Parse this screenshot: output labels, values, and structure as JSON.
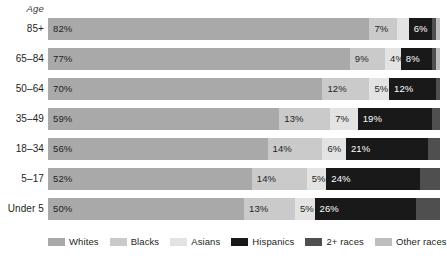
{
  "chart_data": {
    "type": "bar",
    "subtype": "horizontal-100-percent-stacked",
    "title": "",
    "xlabel": "",
    "ylabel": "Age",
    "xlim": [
      0,
      100
    ],
    "grid": false,
    "legend_position": "bottom",
    "categories": [
      "85+",
      "65–84",
      "50–64",
      "35–49",
      "18–34",
      "5–17",
      "Under 5"
    ],
    "series": [
      {
        "name": "Whites",
        "color": "#a9a9a9",
        "values": [
          82,
          77,
          70,
          59,
          56,
          52,
          50
        ]
      },
      {
        "name": "Blacks",
        "color": "#cacaca",
        "values": [
          7,
          9,
          12,
          13,
          14,
          14,
          13
        ]
      },
      {
        "name": "Asians",
        "color": "#e3e3e3",
        "values": [
          3,
          4,
          5,
          7,
          6,
          5,
          5
        ]
      },
      {
        "name": "Hispanics",
        "color": "#191919",
        "values": [
          6,
          8,
          12,
          19,
          21,
          24,
          26
        ]
      },
      {
        "name": "2+ races",
        "color": "#4f4f4f",
        "values": [
          1,
          1,
          1,
          2,
          3,
          5,
          6
        ]
      },
      {
        "name": "Other races",
        "color": "#bdbdbd",
        "values": [
          1,
          1,
          0,
          0,
          0,
          0,
          0
        ]
      }
    ],
    "rows": [
      {
        "category": "85+",
        "segments": [
          {
            "series": "Whites",
            "value": 82,
            "label": "82%",
            "show_label": true,
            "tone": "light"
          },
          {
            "series": "Blacks",
            "value": 7,
            "label": "7%",
            "show_label": true,
            "tone": "light"
          },
          {
            "series": "Asians",
            "value": 3,
            "label": "3%",
            "show_label": false,
            "tone": "light"
          },
          {
            "series": "Hispanics",
            "value": 6,
            "label": "6%",
            "show_label": true,
            "tone": "dark"
          },
          {
            "series": "2+ races",
            "value": 1,
            "label": "1%",
            "show_label": false,
            "tone": "dark"
          },
          {
            "series": "Other races",
            "value": 1,
            "label": "1%",
            "show_label": false,
            "tone": "light"
          }
        ]
      },
      {
        "category": "65–84",
        "segments": [
          {
            "series": "Whites",
            "value": 77,
            "label": "77%",
            "show_label": true,
            "tone": "light"
          },
          {
            "series": "Blacks",
            "value": 9,
            "label": "9%",
            "show_label": true,
            "tone": "light"
          },
          {
            "series": "Asians",
            "value": 4,
            "label": "4%",
            "show_label": true,
            "tone": "light"
          },
          {
            "series": "Hispanics",
            "value": 8,
            "label": "8%",
            "show_label": true,
            "tone": "dark"
          },
          {
            "series": "2+ races",
            "value": 1,
            "label": "1%",
            "show_label": false,
            "tone": "dark"
          },
          {
            "series": "Other races",
            "value": 1,
            "label": "1%",
            "show_label": false,
            "tone": "light"
          }
        ]
      },
      {
        "category": "50–64",
        "segments": [
          {
            "series": "Whites",
            "value": 70,
            "label": "70%",
            "show_label": true,
            "tone": "light"
          },
          {
            "series": "Blacks",
            "value": 12,
            "label": "12%",
            "show_label": true,
            "tone": "light"
          },
          {
            "series": "Asians",
            "value": 5,
            "label": "5%",
            "show_label": true,
            "tone": "light"
          },
          {
            "series": "Hispanics",
            "value": 12,
            "label": "12%",
            "show_label": true,
            "tone": "dark"
          },
          {
            "series": "2+ races",
            "value": 1,
            "label": "1%",
            "show_label": false,
            "tone": "dark"
          }
        ]
      },
      {
        "category": "35–49",
        "segments": [
          {
            "series": "Whites",
            "value": 59,
            "label": "59%",
            "show_label": true,
            "tone": "light"
          },
          {
            "series": "Blacks",
            "value": 13,
            "label": "13%",
            "show_label": true,
            "tone": "light"
          },
          {
            "series": "Asians",
            "value": 7,
            "label": "7%",
            "show_label": true,
            "tone": "light"
          },
          {
            "series": "Hispanics",
            "value": 19,
            "label": "19%",
            "show_label": true,
            "tone": "dark"
          },
          {
            "series": "2+ races",
            "value": 2,
            "label": "2%",
            "show_label": false,
            "tone": "dark"
          }
        ]
      },
      {
        "category": "18–34",
        "segments": [
          {
            "series": "Whites",
            "value": 56,
            "label": "56%",
            "show_label": true,
            "tone": "light"
          },
          {
            "series": "Blacks",
            "value": 14,
            "label": "14%",
            "show_label": true,
            "tone": "light"
          },
          {
            "series": "Asians",
            "value": 6,
            "label": "6%",
            "show_label": true,
            "tone": "light"
          },
          {
            "series": "Hispanics",
            "value": 21,
            "label": "21%",
            "show_label": true,
            "tone": "dark"
          },
          {
            "series": "2+ races",
            "value": 3,
            "label": "3%",
            "show_label": false,
            "tone": "dark"
          }
        ]
      },
      {
        "category": "5–17",
        "segments": [
          {
            "series": "Whites",
            "value": 52,
            "label": "52%",
            "show_label": true,
            "tone": "light"
          },
          {
            "series": "Blacks",
            "value": 14,
            "label": "14%",
            "show_label": true,
            "tone": "light"
          },
          {
            "series": "Asians",
            "value": 5,
            "label": "5%",
            "show_label": true,
            "tone": "light"
          },
          {
            "series": "Hispanics",
            "value": 24,
            "label": "24%",
            "show_label": true,
            "tone": "dark"
          },
          {
            "series": "2+ races",
            "value": 5,
            "label": "5%",
            "show_label": false,
            "tone": "dark"
          }
        ]
      },
      {
        "category": "Under 5",
        "segments": [
          {
            "series": "Whites",
            "value": 50,
            "label": "50%",
            "show_label": true,
            "tone": "light"
          },
          {
            "series": "Blacks",
            "value": 13,
            "label": "13%",
            "show_label": true,
            "tone": "light"
          },
          {
            "series": "Asians",
            "value": 5,
            "label": "5%",
            "show_label": true,
            "tone": "light"
          },
          {
            "series": "Hispanics",
            "value": 26,
            "label": "26%",
            "show_label": true,
            "tone": "dark"
          },
          {
            "series": "2+ races",
            "value": 6,
            "label": "6%",
            "show_label": false,
            "tone": "dark"
          }
        ]
      }
    ],
    "legend": [
      {
        "label": "Whites",
        "color": "#a9a9a9"
      },
      {
        "label": "Blacks",
        "color": "#cacaca"
      },
      {
        "label": "Asians",
        "color": "#e3e3e3"
      },
      {
        "label": "Hispanics",
        "color": "#191919"
      },
      {
        "label": "2+ races",
        "color": "#4f4f4f"
      },
      {
        "label": "Other races",
        "color": "#bdbdbd"
      }
    ]
  }
}
